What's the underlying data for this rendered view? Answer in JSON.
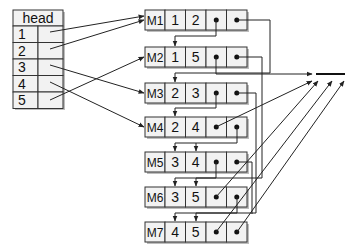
{
  "head_table": {
    "title": "head",
    "rows": [
      "1",
      "2",
      "3",
      "4",
      "5"
    ],
    "pointers_to": [
      "M1",
      "M1",
      "M3",
      "M4",
      "M2"
    ]
  },
  "nodes": [
    {
      "id": "M1",
      "a": "1",
      "b": "2"
    },
    {
      "id": "M2",
      "a": "1",
      "b": "5"
    },
    {
      "id": "M3",
      "a": "2",
      "b": "3"
    },
    {
      "id": "M4",
      "a": "2",
      "b": "4"
    },
    {
      "id": "M5",
      "a": "3",
      "b": "4"
    },
    {
      "id": "M6",
      "a": "3",
      "b": "5"
    },
    {
      "id": "M7",
      "a": "4",
      "b": "5"
    }
  ],
  "null_symbol": "null-terminator",
  "colors": {
    "stroke": "#333333",
    "fill": "#f2f2f2",
    "shadow": "#bdbdbd"
  }
}
